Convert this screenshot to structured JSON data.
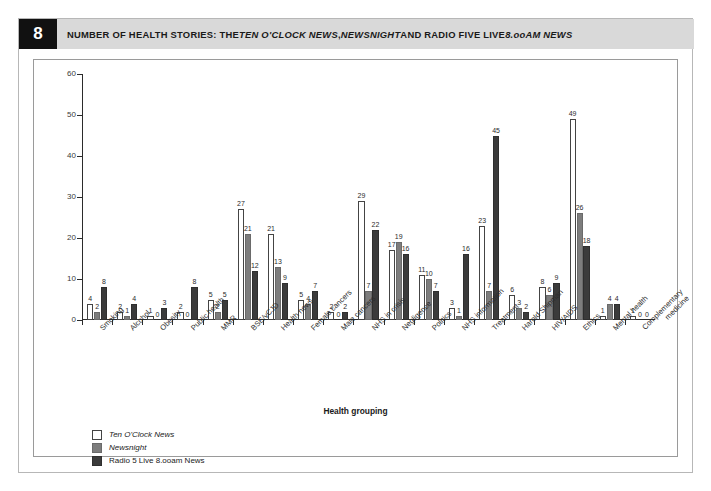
{
  "figure": {
    "number": "8",
    "title_plain": "NUMBER OF HEALTH STORIES: THE TEN O'CLOCK NEWS, NEWSNIGHT AND RADIO FIVE LIVE 8.00AM NEWS",
    "title_parts": [
      {
        "text": "NUMBER OF HEALTH STORIES: THE ",
        "italic": false
      },
      {
        "text": "TEN O'CLOCK NEWS",
        "italic": true
      },
      {
        "text": ", ",
        "italic": false
      },
      {
        "text": "NEWSNIGHT",
        "italic": true
      },
      {
        "text": " AND RADIO FIVE LIVE ",
        "italic": false
      },
      {
        "text": "8.ooAM NEWS",
        "italic": true
      }
    ]
  },
  "colors": {
    "series_ten_oclock": "#ffffff",
    "series_newsnight": "#7d7d7d",
    "series_radio5": "#3b3b3b",
    "axis": "#2b2b2b",
    "caption_bar": "#d9d9d9",
    "badge": "#111111",
    "frame_border": "#9a9a9a"
  },
  "chart_data": {
    "type": "bar",
    "title": "NUMBER OF HEALTH STORIES: THE TEN O'CLOCK NEWS, NEWSNIGHT AND RADIO FIVE LIVE 8.ooAM NEWS",
    "xlabel": "Health grouping",
    "ylabel": "Number of stories",
    "ylim": [
      0,
      60
    ],
    "yticks": [
      0,
      10,
      20,
      30,
      40,
      50,
      60
    ],
    "grid": false,
    "legend_position": "bottom-left",
    "categories": [
      "Smoking",
      "Alcohol",
      "Obesity",
      "Public health",
      "MMR",
      "BSE/vCJD",
      "Health news",
      "Female cancers",
      "Male cancers",
      "NHS in crisis",
      "Negligence",
      "Politics",
      "NHS information",
      "Treatment",
      "Harold Shipman",
      "HIV/AIDS",
      "Ethics",
      "Mental health",
      "Complementary medicine"
    ],
    "series": [
      {
        "name": "Ten O'Clock News",
        "color": "#ffffff",
        "values": [
          4,
          2,
          1,
          2,
          5,
          27,
          21,
          5,
          2,
          29,
          17,
          11,
          3,
          23,
          6,
          8,
          49,
          1,
          1
        ]
      },
      {
        "name": "Newsnight",
        "color": "#7d7d7d",
        "values": [
          2,
          1,
          0,
          0,
          2,
          21,
          13,
          4,
          0,
          7,
          19,
          10,
          1,
          7,
          3,
          6,
          26,
          4,
          0
        ]
      },
      {
        "name": "Radio 5 Live 8.ooam News",
        "color": "#3b3b3b",
        "values": [
          8,
          4,
          3,
          8,
          5,
          12,
          9,
          7,
          2,
          22,
          16,
          7,
          16,
          45,
          2,
          9,
          18,
          4,
          0
        ]
      }
    ]
  },
  "legend": {
    "items": [
      {
        "label": "Ten O'Clock News",
        "italic": true,
        "swatch": "s0"
      },
      {
        "label": "Newsnight",
        "italic": true,
        "swatch": "s1"
      },
      {
        "label": "Radio 5 Live 8.ooam News",
        "italic": false,
        "swatch": "s2"
      }
    ]
  }
}
